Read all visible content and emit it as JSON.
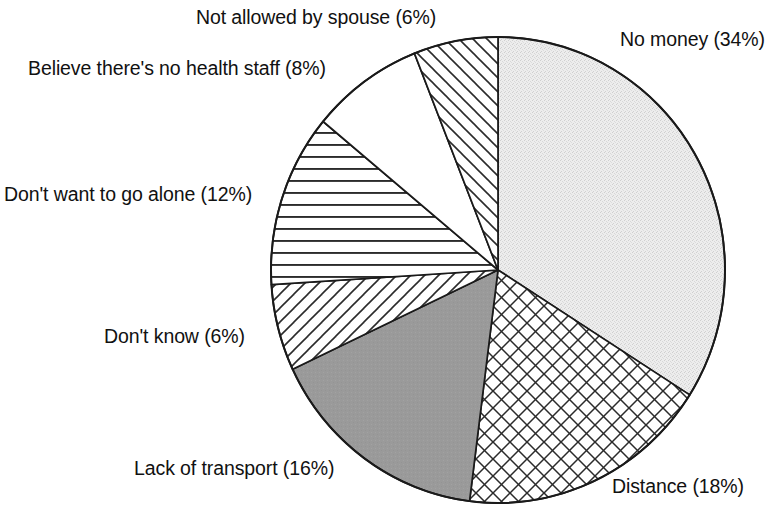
{
  "chart_data": {
    "type": "pie",
    "title": "",
    "subtitle": "",
    "xlabel": "",
    "ylabel": "",
    "legend_position": "none",
    "labels_position": "outside",
    "start_angle_deg": 0,
    "direction": "clockwise",
    "categories": [
      "No money",
      "Distance",
      "Lack of transport",
      "Don't know",
      "Don't want to go alone",
      "Believe there's no health staff",
      "Not allowed by spouse"
    ],
    "values": [
      34,
      18,
      16,
      6,
      12,
      8,
      6
    ],
    "value_unit": "%",
    "total": 100,
    "slices": [
      {
        "label": "No money (34%)",
        "name": "No money",
        "value": 34,
        "fill": "stipple",
        "fill_color": "#ededed",
        "start_deg": 0,
        "end_deg": 122.4
      },
      {
        "label": "Distance (18%)",
        "name": "Distance",
        "value": 18,
        "fill": "crosshatch",
        "fill_color": "#ffffff",
        "start_deg": 122.4,
        "end_deg": 187.2
      },
      {
        "label": "Lack of transport (16%)",
        "name": "Lack of transport",
        "value": 16,
        "fill": "solid-gray",
        "fill_color": "#9a9a9a",
        "start_deg": 187.2,
        "end_deg": 244.8
      },
      {
        "label": "Don't know (6%)",
        "name": "Don't know",
        "value": 6,
        "fill": "diagonal-stripes-up",
        "fill_color": "#ffffff",
        "start_deg": 244.8,
        "end_deg": 266.4
      },
      {
        "label": "Don't want to go alone (12%)",
        "name": "Don't want to go alone",
        "value": 12,
        "fill": "horizontal-stripes",
        "fill_color": "#ffffff",
        "start_deg": 266.4,
        "end_deg": 309.6
      },
      {
        "label": "Believe there's no health staff (8%)",
        "name": "Believe there's no health staff",
        "value": 8,
        "fill": "blank-white",
        "fill_color": "#ffffff",
        "start_deg": 309.6,
        "end_deg": 338.4
      },
      {
        "label": "Not allowed by spouse (6%)",
        "name": "Not allowed by spouse",
        "value": 6,
        "fill": "diagonal-stripes-down",
        "fill_color": "#ffffff",
        "start_deg": 338.4,
        "end_deg": 360
      }
    ],
    "outline_color": "#1a1a1a",
    "background_color": "#ffffff"
  }
}
